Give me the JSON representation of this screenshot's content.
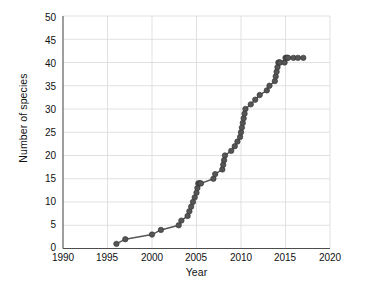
{
  "chart_data": {
    "type": "line",
    "title": "",
    "xlabel": "Year",
    "ylabel": "Number of species",
    "xlim": [
      1990,
      2020
    ],
    "ylim": [
      0,
      50
    ],
    "xticks": [
      1990,
      1995,
      2000,
      2005,
      2010,
      2015,
      2020
    ],
    "yticks": [
      0,
      5,
      10,
      15,
      20,
      25,
      30,
      35,
      40,
      45,
      50
    ],
    "grid": true,
    "legend": "none",
    "marker": "circle",
    "marker_color": "#555555",
    "line_color": "#555555",
    "series": [
      {
        "name": "Cumulative number of species",
        "x": [
          1996.0,
          1997.0,
          2000.0,
          2001.0,
          2003.0,
          2003.3,
          2004.0,
          2004.2,
          2004.4,
          2004.6,
          2004.8,
          2005.0,
          2005.1,
          2005.2,
          2005.3,
          2005.4,
          2005.5,
          2006.9,
          2007.1,
          2007.9,
          2008.0,
          2008.1,
          2008.2,
          2008.9,
          2009.3,
          2009.6,
          2009.9,
          2010.0,
          2010.1,
          2010.2,
          2010.3,
          2010.4,
          2010.5,
          2011.1,
          2011.6,
          2012.1,
          2012.9,
          2013.2,
          2013.8,
          2013.9,
          2014.0,
          2014.1,
          2014.2,
          2014.3,
          2014.4,
          2014.9,
          2015.0,
          2015.1,
          2015.2,
          2015.3,
          2015.9,
          2016.4,
          2017.0
        ],
        "y": [
          1,
          2,
          3,
          4,
          5,
          6,
          7,
          8,
          9,
          10,
          11,
          12,
          13,
          14,
          14,
          14,
          14,
          15,
          16,
          17,
          18,
          19,
          20,
          21,
          22,
          23,
          24,
          25,
          26,
          27,
          28,
          29,
          30,
          31,
          32,
          33,
          34,
          35,
          36,
          37,
          38,
          39,
          40,
          40,
          40,
          40,
          41,
          41,
          41,
          41,
          41,
          41,
          41
        ]
      }
    ],
    "points": [
      {
        "year": 1996,
        "value": 1
      },
      {
        "year": 1997,
        "value": 2
      },
      {
        "year": 2000,
        "value": 3
      },
      {
        "year": 2001,
        "value": 4
      },
      {
        "year": 2003,
        "value": 5
      },
      {
        "year": 2003,
        "value": 6
      },
      {
        "year": 2004,
        "value": 7
      },
      {
        "year": 2004,
        "value": 8
      },
      {
        "year": 2004,
        "value": 9
      },
      {
        "year": 2005,
        "value": 10
      },
      {
        "year": 2005,
        "value": 11
      },
      {
        "year": 2005,
        "value": 12
      },
      {
        "year": 2005,
        "value": 13
      },
      {
        "year": 2005,
        "value": 14
      },
      {
        "year": 2007,
        "value": 15
      },
      {
        "year": 2007,
        "value": 16
      },
      {
        "year": 2008,
        "value": 17
      },
      {
        "year": 2008,
        "value": 18
      },
      {
        "year": 2008,
        "value": 19
      },
      {
        "year": 2008,
        "value": 20
      },
      {
        "year": 2009,
        "value": 21
      },
      {
        "year": 2009,
        "value": 22
      },
      {
        "year": 2010,
        "value": 23
      },
      {
        "year": 2010,
        "value": 24
      },
      {
        "year": 2010,
        "value": 25
      },
      {
        "year": 2010,
        "value": 26
      },
      {
        "year": 2010,
        "value": 27
      },
      {
        "year": 2010,
        "value": 28
      },
      {
        "year": 2011,
        "value": 29
      },
      {
        "year": 2011,
        "value": 30
      },
      {
        "year": 2012,
        "value": 31
      },
      {
        "year": 2012,
        "value": 32
      },
      {
        "year": 2013,
        "value": 33
      },
      {
        "year": 2014,
        "value": 34
      },
      {
        "year": 2014,
        "value": 35
      },
      {
        "year": 2014,
        "value": 36
      },
      {
        "year": 2014,
        "value": 37
      },
      {
        "year": 2015,
        "value": 38
      },
      {
        "year": 2015,
        "value": 39
      },
      {
        "year": 2016,
        "value": 40
      },
      {
        "year": 2017,
        "value": 41
      }
    ]
  },
  "axes": {
    "x_label": "Year",
    "y_label": "Number of species",
    "x_tick_labels": [
      "1990",
      "1995",
      "2000",
      "2005",
      "2010",
      "2015",
      "2020"
    ],
    "y_tick_labels": [
      "0",
      "5",
      "10",
      "15",
      "20",
      "25",
      "30",
      "35",
      "40",
      "45",
      "50"
    ]
  },
  "style": {
    "background": "#ffffff",
    "grid_color": "#d9d9d9",
    "axis_color": "#4d4d4d",
    "series_color": "#555555",
    "text_color": "#111111"
  }
}
